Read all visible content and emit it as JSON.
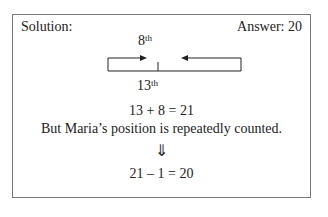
{
  "header": {
    "left_label": "Solution:",
    "right_label": "Answer: 20"
  },
  "diagram": {
    "top_marker": {
      "number": "8",
      "suffix": "th"
    },
    "bottom_marker": {
      "number": "13",
      "suffix": "th"
    }
  },
  "steps": {
    "equation1": "13 + 8 = 21",
    "note": "But Maria’s position is repeatedly counted.",
    "arrow": "⇓",
    "equation2": "21 – 1 = 20"
  }
}
